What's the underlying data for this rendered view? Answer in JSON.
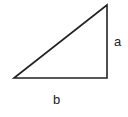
{
  "diagram": {
    "shape": "right-triangle",
    "vertices": [
      [
        14,
        78
      ],
      [
        107,
        5
      ],
      [
        107,
        78
      ]
    ],
    "stroke_color": "#222222",
    "labels": {
      "vertical_side": "a",
      "horizontal_side": "b"
    }
  }
}
